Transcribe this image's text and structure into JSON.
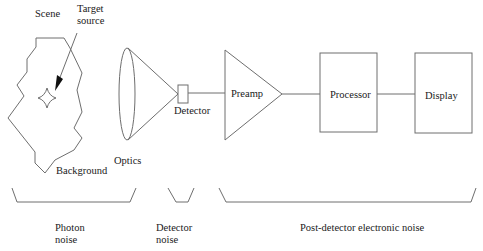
{
  "diagram": {
    "colors": {
      "stroke": "#6e6e6e",
      "text": "#1a1a1a",
      "arrow": "#111111",
      "background": "#ffffff"
    },
    "scene": {
      "label": "Scene",
      "target_label_line1": "Target",
      "target_label_line2": "source",
      "background_label": "Background"
    },
    "optics": {
      "label": "Optics"
    },
    "detector": {
      "label": "Detector"
    },
    "preamp": {
      "label": "Preamp"
    },
    "processor": {
      "label": "Processor"
    },
    "display": {
      "label": "Display"
    },
    "noise_groups": [
      {
        "line1": "Photon",
        "line2": "noise"
      },
      {
        "line1": "Detector",
        "line2": "noise"
      },
      {
        "line1": "Post-detector electronic  noise",
        "line2": ""
      }
    ]
  }
}
